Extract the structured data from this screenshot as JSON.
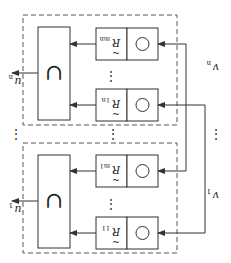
{
  "orientation": "rotated-180",
  "colors": {
    "stroke": "#333333",
    "dashed": "#555555",
    "text": "#222222",
    "background": "#ffffff"
  },
  "groups": [
    {
      "name": "group-n",
      "output_label": "u",
      "output_subscript": "n",
      "union_symbol": "∪",
      "rows": [
        {
          "label": "R",
          "subscript": "mn",
          "op_symbol": "○"
        },
        {
          "label": "R",
          "subscript": "1n",
          "op_symbol": "○"
        }
      ],
      "row_ellipsis": "⋮"
    },
    {
      "name": "group-1",
      "output_label": "u",
      "output_subscript": "1",
      "union_symbol": "∪",
      "rows": [
        {
          "label": "R",
          "subscript": "m1",
          "op_symbol": "○"
        },
        {
          "label": "R",
          "subscript": "11",
          "op_symbol": "○"
        }
      ],
      "row_ellipsis": "⋮"
    }
  ],
  "inputs": [
    {
      "label": "v",
      "subscript": "n"
    },
    {
      "label": "v",
      "subscript": "1"
    }
  ],
  "between_ellipsis": "⋮"
}
